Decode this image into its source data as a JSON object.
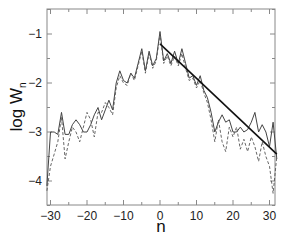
{
  "chart_data": {
    "type": "line",
    "title": "",
    "xlabel": "n",
    "ylabel": "log W",
    "ylabel_subscript": "n",
    "xlim": [
      -31,
      32
    ],
    "ylim": [
      -4.5,
      -0.5
    ],
    "xticks": [
      -30,
      -20,
      -10,
      0,
      10,
      20,
      30
    ],
    "yticks": [
      -1,
      -2,
      -3,
      -4
    ],
    "grid": false,
    "legend": null,
    "series": [
      {
        "name": "solid",
        "style": "solid",
        "color": "#444444",
        "x": [
          -31,
          -30,
          -29,
          -28,
          -27,
          -26,
          -25,
          -24,
          -23,
          -22,
          -21,
          -20,
          -19,
          -18,
          -17,
          -16,
          -15,
          -14,
          -13,
          -12,
          -11,
          -10,
          -9,
          -8,
          -7,
          -6,
          -5,
          -4,
          -3,
          -2,
          -1,
          0,
          1,
          2,
          3,
          4,
          5,
          6,
          7,
          8,
          9,
          10,
          11,
          12,
          13,
          14,
          15,
          16,
          17,
          18,
          19,
          20,
          21,
          22,
          23,
          24,
          25,
          26,
          27,
          28,
          29,
          30,
          31,
          32
        ],
        "values": [
          -4.1,
          -3.0,
          -3.0,
          -3.05,
          -2.6,
          -3.05,
          -3.05,
          -2.85,
          -2.75,
          -2.85,
          -3.0,
          -3.0,
          -2.85,
          -2.65,
          -2.5,
          -2.75,
          -2.55,
          -2.35,
          -2.55,
          -2.0,
          -1.75,
          -1.95,
          -2.0,
          -1.8,
          -1.9,
          -1.6,
          -1.3,
          -1.75,
          -1.35,
          -1.65,
          -1.5,
          -0.95,
          -1.55,
          -1.4,
          -1.6,
          -1.35,
          -1.6,
          -1.3,
          -1.6,
          -1.9,
          -1.85,
          -2.05,
          -1.85,
          -2.15,
          -2.3,
          -2.6,
          -3.0,
          -2.8,
          -2.65,
          -2.8,
          -2.75,
          -3.0,
          -3.0,
          -2.9,
          -3.0,
          -2.95,
          -2.8,
          -2.6,
          -3.0,
          -2.85,
          -3.0,
          -3.3,
          -2.8,
          -3.55
        ]
      },
      {
        "name": "dashed",
        "style": "dashed",
        "color": "#555555",
        "x": [
          -31,
          -30,
          -29,
          -28,
          -27,
          -26,
          -25,
          -24,
          -23,
          -22,
          -21,
          -20,
          -19,
          -18,
          -17,
          -16,
          -15,
          -14,
          -13,
          -12,
          -11,
          -10,
          -9,
          -8,
          -7,
          -6,
          -5,
          -4,
          -3,
          -2,
          -1,
          0,
          1,
          2,
          3,
          4,
          5,
          6,
          7,
          8,
          9,
          10,
          11,
          12,
          13,
          14,
          15,
          16,
          17,
          18,
          19,
          20,
          21,
          22,
          23,
          24,
          25,
          26,
          27,
          28,
          29,
          30,
          31,
          32
        ],
        "values": [
          -4.2,
          -3.7,
          -3.45,
          -3.2,
          -2.7,
          -3.55,
          -3.2,
          -2.9,
          -3.0,
          -3.2,
          -2.9,
          -2.6,
          -2.75,
          -3.1,
          -2.6,
          -2.6,
          -2.4,
          -2.5,
          -2.65,
          -2.1,
          -1.85,
          -2.0,
          -2.05,
          -1.8,
          -1.95,
          -1.65,
          -1.35,
          -1.8,
          -1.4,
          -1.7,
          -1.55,
          -1.0,
          -1.6,
          -1.45,
          -1.65,
          -1.45,
          -1.65,
          -1.4,
          -1.7,
          -1.95,
          -1.9,
          -2.1,
          -1.95,
          -2.2,
          -2.4,
          -2.75,
          -3.2,
          -2.75,
          -3.2,
          -3.4,
          -2.9,
          -3.1,
          -2.9,
          -3.35,
          -3.15,
          -3.4,
          -3.1,
          -3.3,
          -3.6,
          -3.2,
          -3.5,
          -3.7,
          -4.25,
          -3.5
        ]
      },
      {
        "name": "fit",
        "style": "solid-bold",
        "color": "#111111",
        "x": [
          0,
          32
        ],
        "values": [
          -1.2,
          -3.45
        ]
      }
    ]
  },
  "axes": {
    "x_title": "n",
    "y_title_main": "log W",
    "y_title_sub": "n",
    "x_tick_labels": [
      "−30",
      "−20",
      "−10",
      "0",
      "10",
      "20",
      "30"
    ],
    "y_tick_labels": [
      "−1",
      "−2",
      "−3",
      "−4"
    ]
  }
}
